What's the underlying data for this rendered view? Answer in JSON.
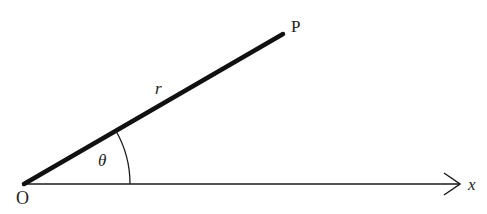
{
  "diagram": {
    "type": "polar-coordinates",
    "labels": {
      "origin": "O",
      "point": "P",
      "radius": "r",
      "angle": "θ",
      "axis": "x"
    },
    "colors": {
      "stroke": "#1a1a1a",
      "background": "#ffffff"
    }
  }
}
